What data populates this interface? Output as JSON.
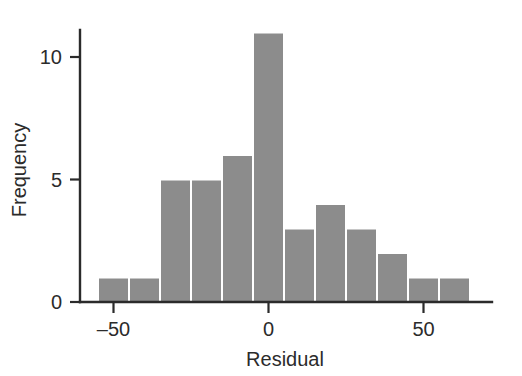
{
  "chart_data": {
    "type": "bar",
    "title": "",
    "subtitle": "",
    "xlabel": "Residual",
    "ylabel": "Frequency",
    "xlim": [
      -62,
      -62
    ],
    "ylim": [
      0,
      11.6
    ],
    "grid": false,
    "legend": null,
    "bar_color": "#8c8c8c",
    "bar_edge_color": "#ffffff",
    "axis_color": "#2b2b2b",
    "x_ticks": [
      -50,
      0,
      50
    ],
    "x_tick_labels": [
      "–50",
      "0",
      "50"
    ],
    "y_ticks": [
      0,
      5,
      10
    ],
    "y_tick_labels": [
      "0",
      "5",
      "10"
    ],
    "bin_edges": [
      -55,
      -45,
      -35,
      -25,
      -15,
      -5,
      5,
      15,
      25,
      35,
      45,
      55,
      65
    ],
    "bins": [
      {
        "left": -55,
        "right": -45,
        "value": 1
      },
      {
        "left": -45,
        "right": -35,
        "value": 1
      },
      {
        "left": -35,
        "right": -25,
        "value": 5
      },
      {
        "left": -25,
        "right": -15,
        "value": 5
      },
      {
        "left": -15,
        "right": -5,
        "value": 6
      },
      {
        "left": -5,
        "right": 5,
        "value": 11
      },
      {
        "left": 5,
        "right": 15,
        "value": 3
      },
      {
        "left": 15,
        "right": 25,
        "value": 4
      },
      {
        "left": 25,
        "right": 35,
        "value": 3
      },
      {
        "left": 35,
        "right": 45,
        "value": 2
      },
      {
        "left": 45,
        "right": 55,
        "value": 1
      },
      {
        "left": 55,
        "right": 65,
        "value": 1
      }
    ],
    "categories": [
      "-55..-45",
      "-45..-35",
      "-35..-25",
      "-25..-15",
      "-15..-5",
      "-5..5",
      "5..15",
      "15..25",
      "25..35",
      "35..45",
      "45..55",
      "55..65"
    ],
    "values": [
      1,
      1,
      5,
      5,
      6,
      11,
      3,
      4,
      3,
      2,
      1,
      1
    ]
  }
}
